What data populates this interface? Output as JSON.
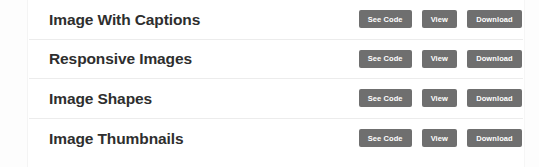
{
  "page": {
    "background_color": "#ffffff",
    "separator_color": "#ececec"
  },
  "theme": {
    "button_bg": "#6f6f6f",
    "button_text": "#ffffff",
    "title_text": "#2e2e2e"
  },
  "actions": {
    "see_code_label": "See Code",
    "view_label": "View",
    "download_label": "Download"
  },
  "list": {
    "rows": [
      {
        "title": "Image With Captions",
        "see_code_label": "See Code",
        "view_label": "View",
        "download_label": "Download"
      },
      {
        "title": "Responsive Images",
        "see_code_label": "See Code",
        "view_label": "View",
        "download_label": "Download"
      },
      {
        "title": "Image Shapes",
        "see_code_label": "See Code",
        "view_label": "View",
        "download_label": "Download"
      },
      {
        "title": "Image Thumbnails",
        "see_code_label": "See Code",
        "view_label": "View",
        "download_label": "Download"
      }
    ]
  }
}
